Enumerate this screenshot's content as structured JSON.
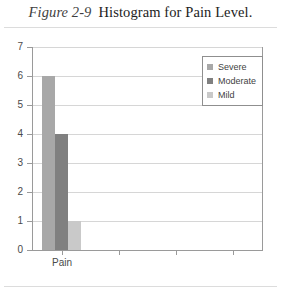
{
  "figure": {
    "number": "Figure 2-9",
    "title": "Histogram for Pain Level."
  },
  "chart_data": {
    "type": "bar",
    "title": "Histogram for Pain Level.",
    "xlabel": "",
    "ylabel": "",
    "categories": [
      "Pain",
      "",
      "",
      ""
    ],
    "series": [
      {
        "name": "Severe",
        "values": [
          6,
          null,
          null,
          null
        ],
        "color": "#a8a8a8"
      },
      {
        "name": "Moderate",
        "values": [
          4,
          null,
          null,
          null
        ],
        "color": "#808080"
      },
      {
        "name": "Mild",
        "values": [
          1,
          null,
          null,
          null
        ],
        "color": "#c9c9c9"
      }
    ],
    "ylim": [
      0,
      7
    ],
    "yticks": [
      0,
      1,
      2,
      3,
      4,
      5,
      6,
      7
    ],
    "ytick_labels": [
      "0",
      "1",
      "2",
      "3",
      "4",
      "5",
      "6",
      "7"
    ],
    "grid": "horizontal",
    "legend_position": "top-right",
    "legend_entries": [
      "Severe",
      "Moderate",
      "Mild"
    ]
  },
  "colors": {
    "severe": "#a8a8a8",
    "moderate": "#808080",
    "mild": "#c9c9c9",
    "axis": "#9a9a9a",
    "grid": "#d6d6d6",
    "rule": "#dcdcdc"
  }
}
